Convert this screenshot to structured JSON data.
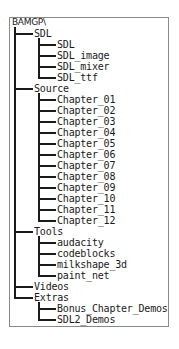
{
  "tree": {
    "root": "BAMGP\\",
    "folders": [
      {
        "name": "SDL",
        "children": [
          "SDL",
          "SDL_image",
          "SDL_mixer",
          "SDL_ttf"
        ]
      },
      {
        "name": "Source",
        "children": [
          "Chapter_01",
          "Chapter_02",
          "Chapter_03",
          "Chapter_04",
          "Chapter_05",
          "Chapter_06",
          "Chapter_07",
          "Chapter_08",
          "Chapter_09",
          "Chapter_10",
          "Chapter_11",
          "Chapter_12"
        ]
      },
      {
        "name": "Tools",
        "children": [
          "audacity",
          "codeblocks",
          "milkshape_3d",
          "paint_net"
        ]
      },
      {
        "name": "Videos",
        "children": []
      },
      {
        "name": "Extras",
        "children": [
          "Bonus_Chapter_Demos",
          "SDL2_Demos"
        ]
      }
    ]
  },
  "colors": {
    "border": "#8a8a8a",
    "line": "#1a1a1a",
    "text": "#1a1a1a",
    "background": "#ffffff"
  }
}
